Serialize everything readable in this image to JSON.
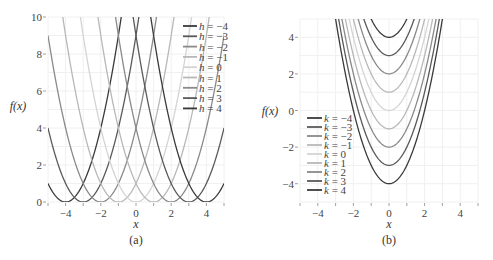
{
  "chart_data": [
    {
      "type": "line",
      "caption": "(a)",
      "function": "f(x) = (x - h)^2",
      "xlabel": "x",
      "ylabel": "f(x)",
      "xlim": [
        -5,
        5
      ],
      "ylim": [
        0,
        10
      ],
      "xticks": [
        -4,
        -2,
        0,
        2,
        4
      ],
      "yticks": [
        0,
        2,
        4,
        6,
        8,
        10
      ],
      "grid": true,
      "legend_position": "upper right",
      "param_name": "h",
      "series": [
        {
          "name": "h = -4",
          "param": -4,
          "color": "#3a3a3a"
        },
        {
          "name": "h = -3",
          "param": -3,
          "color": "#5a5a5a"
        },
        {
          "name": "h = -2",
          "param": -2,
          "color": "#8a8a8a"
        },
        {
          "name": "h = -1",
          "param": -1,
          "color": "#b8b8b8"
        },
        {
          "name": "h = 0",
          "param": 0,
          "color": "#d4d4d4"
        },
        {
          "name": "h = 1",
          "param": 1,
          "color": "#b8b8b8"
        },
        {
          "name": "h = 2",
          "param": 2,
          "color": "#8a8a8a"
        },
        {
          "name": "h = 3",
          "param": 3,
          "color": "#5a5a5a"
        },
        {
          "name": "h = 4",
          "param": 4,
          "color": "#3a3a3a"
        }
      ]
    },
    {
      "type": "line",
      "caption": "(b)",
      "function": "f(x) = x^2 - k",
      "xlabel": "x",
      "ylabel": "f(x)",
      "xlim": [
        -5,
        5
      ],
      "ylim": [
        -5,
        5
      ],
      "xticks": [
        -4,
        -2,
        0,
        2,
        4
      ],
      "yticks": [
        -4,
        -2,
        0,
        2,
        4
      ],
      "grid": true,
      "legend_position": "lower left",
      "param_name": "k",
      "series": [
        {
          "name": "k = -4",
          "param": -4,
          "color": "#3a3a3a"
        },
        {
          "name": "k = -3",
          "param": -3,
          "color": "#5a5a5a"
        },
        {
          "name": "k = -2",
          "param": -2,
          "color": "#8a8a8a"
        },
        {
          "name": "k = -1",
          "param": -1,
          "color": "#b8b8b8"
        },
        {
          "name": "k = 0",
          "param": 0,
          "color": "#d4d4d4"
        },
        {
          "name": "k = 1",
          "param": 1,
          "color": "#b8b8b8"
        },
        {
          "name": "k = 2",
          "param": 2,
          "color": "#8a8a8a"
        },
        {
          "name": "k = 3",
          "param": 3,
          "color": "#5a5a5a"
        },
        {
          "name": "k = 4",
          "param": 4,
          "color": "#3a3a3a"
        }
      ]
    }
  ]
}
